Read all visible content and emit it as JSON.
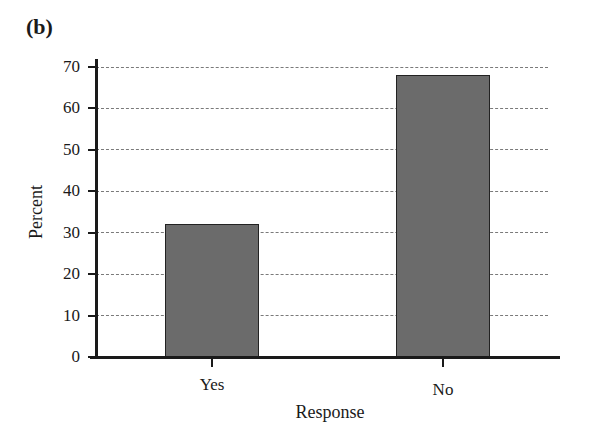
{
  "panel_label": "(b)",
  "chart_data": {
    "type": "bar",
    "title": "",
    "categories": [
      "Yes",
      "No"
    ],
    "values": [
      32,
      68
    ],
    "xlabel": "Response",
    "ylabel": "Percent",
    "ylim": [
      0,
      70
    ],
    "yticks": [
      0,
      10,
      20,
      30,
      40,
      50,
      60,
      70
    ],
    "grid": "horizontal dashed",
    "legend": "none",
    "bar_color": "#6b6b6b"
  }
}
